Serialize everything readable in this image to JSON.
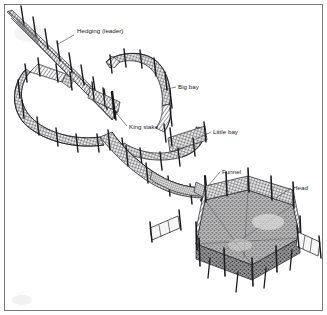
{
  "figure": {
    "background_color": "#ffffff",
    "ink_color": "#17171a",
    "frame_color": "#6d6d70",
    "net_fill_color": "#7a7a7d",
    "floor_fill_color": "#8e8e90",
    "stake_color": "#232326"
  },
  "labels": [
    {
      "id": "hedging",
      "text": "Hedging (leader)",
      "x": 77,
      "y": 33,
      "anchor": "start"
    },
    {
      "id": "big-bay",
      "text": "Big bay",
      "x": 178,
      "y": 89,
      "anchor": "start"
    },
    {
      "id": "king-stake",
      "text": "King stake",
      "x": 129,
      "y": 129,
      "anchor": "start"
    },
    {
      "id": "little-bay",
      "text": "Little bay",
      "x": 213,
      "y": 134,
      "anchor": "start"
    },
    {
      "id": "funnel",
      "text": "Funnel",
      "x": 222,
      "y": 174,
      "anchor": "start"
    },
    {
      "id": "head",
      "text": "Head",
      "x": 293,
      "y": 190,
      "anchor": "start"
    }
  ],
  "leader_lines": [
    {
      "id": "hedging",
      "x1": 74,
      "y1": 35,
      "x2": 58,
      "y2": 44
    },
    {
      "id": "big-bay",
      "x1": 176,
      "y1": 87,
      "x2": 163,
      "y2": 90
    },
    {
      "id": "king-stake",
      "x1": 127,
      "y1": 126,
      "x2": 112,
      "y2": 108
    },
    {
      "id": "little-bay",
      "x1": 211,
      "y1": 132,
      "x2": 196,
      "y2": 139
    },
    {
      "id": "funnel",
      "x1": 220,
      "y1": 172,
      "x2": 208,
      "y2": 186
    },
    {
      "id": "head",
      "x1": 291,
      "y1": 188,
      "x2": 276,
      "y2": 198
    }
  ],
  "structure": {
    "hedging_leader": {
      "name": "Hedging (leader)",
      "description": "Long straight netted fence running from upper-left into the trap",
      "stake_count": 9
    },
    "big_bay": {
      "name": "Big bay",
      "description": "Large curved netted chamber on the upper right",
      "stake_count": 8
    },
    "little_bay": {
      "name": "Little bay",
      "description": "Smaller curved netted chamber below the big bay",
      "stake_count": 6
    },
    "left_bay": {
      "name": "Left bay",
      "description": "Curved netted chamber at the left of the leader",
      "stake_count": 7
    },
    "king_stake": {
      "name": "King stake",
      "description": "Principal heavy stake at the junction of the bays"
    },
    "funnel": {
      "name": "Funnel",
      "description": "Fine-mesh tapered entrance leading into the head",
      "mesh": "fine"
    },
    "head": {
      "name": "Head",
      "description": "Hexagonal pound enclosure with netted floor where fish are retained",
      "sides": 6,
      "stake_count": 10
    }
  }
}
